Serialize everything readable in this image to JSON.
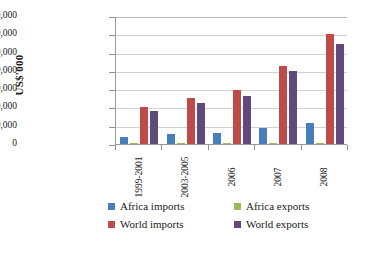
{
  "chart_data": {
    "type": "bar",
    "title": "",
    "xlabel": "",
    "ylabel": "US$'000",
    "ylim": [
      0,
      140000000
    ],
    "ytick_step": 20000000,
    "grid": true,
    "legend_position": "bottom",
    "categories": [
      "1999-2001",
      "2003-2005",
      "2006",
      "2007",
      "2008"
    ],
    "ytick_labels": [
      "0",
      "2,00,00,000",
      "4,00,00,000",
      "6,00,00,000",
      "8,00,00,000",
      "10,00,00,000",
      "12,00,00,000",
      "14,00,00,000"
    ],
    "ytick_values": [
      0,
      20000000,
      40000000,
      60000000,
      80000000,
      100000000,
      120000000,
      140000000
    ],
    "series": [
      {
        "name": "Africa imports",
        "color": "#4a7ebb",
        "values": [
          7500000,
          10500000,
          12500000,
          18000000,
          23000000
        ]
      },
      {
        "name": "Africa exports",
        "color": "#9bbb59",
        "values": [
          300000,
          350000,
          400000,
          500000,
          600000
        ]
      },
      {
        "name": "World imports",
        "color": "#be4b48",
        "values": [
          40000000,
          50500000,
          59000000,
          85500000,
          120500000
        ]
      },
      {
        "name": "World exports",
        "color": "#604a7b",
        "values": [
          36000000,
          44500000,
          52000000,
          80000000,
          109000000
        ]
      }
    ]
  }
}
